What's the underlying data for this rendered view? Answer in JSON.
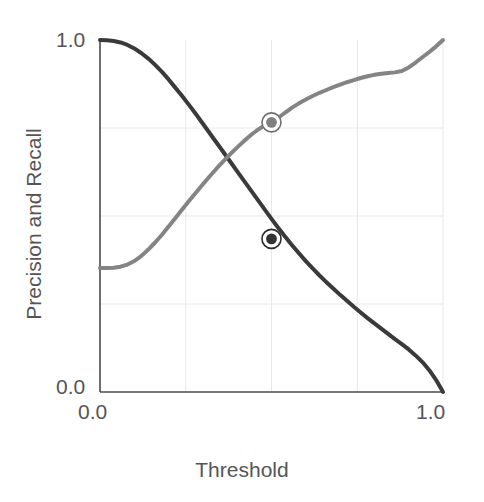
{
  "chart_data": {
    "type": "line",
    "title": "",
    "xlabel": "Threshold",
    "ylabel": "Precision and Recall",
    "xlim": [
      0.0,
      1.0
    ],
    "ylim": [
      0.0,
      1.0
    ],
    "xticks": [
      "0.0",
      "1.0"
    ],
    "xtick_values": [
      0.0,
      1.0
    ],
    "yticks": [
      "1.0",
      "0.0"
    ],
    "ytick_values": [
      1.0,
      0.0
    ],
    "grid": true,
    "grid_color": "#e8e8e8",
    "grid_x": [
      0.25,
      0.5,
      0.75,
      1.0
    ],
    "grid_y": [
      0.25,
      0.5,
      0.75
    ],
    "legend": "none",
    "axis_color": "#4a4a4a",
    "series": [
      {
        "name": "Precision",
        "color": "#3a3a3a",
        "linewidth": 4,
        "x": [
          0.0,
          0.02,
          0.04,
          0.06,
          0.08,
          0.1,
          0.12,
          0.14,
          0.16,
          0.18,
          0.2,
          0.22,
          0.24,
          0.26,
          0.28,
          0.3,
          0.32,
          0.34,
          0.36,
          0.38,
          0.4,
          0.42,
          0.44,
          0.46,
          0.48,
          0.5,
          0.52,
          0.54,
          0.56,
          0.58,
          0.6,
          0.62,
          0.64,
          0.66,
          0.68,
          0.7,
          0.72,
          0.74,
          0.76,
          0.78,
          0.8,
          0.82,
          0.84,
          0.86,
          0.88,
          0.9,
          0.92,
          0.94,
          0.96,
          0.98,
          1.0
        ],
        "values": [
          1.0,
          0.999,
          0.997,
          0.993,
          0.986,
          0.976,
          0.963,
          0.948,
          0.93,
          0.91,
          0.888,
          0.864,
          0.84,
          0.815,
          0.789,
          0.762,
          0.735,
          0.708,
          0.681,
          0.654,
          0.627,
          0.6,
          0.573,
          0.546,
          0.519,
          0.492,
          0.466,
          0.441,
          0.417,
          0.394,
          0.372,
          0.351,
          0.331,
          0.312,
          0.294,
          0.276,
          0.259,
          0.242,
          0.226,
          0.21,
          0.195,
          0.18,
          0.165,
          0.15,
          0.136,
          0.121,
          0.104,
          0.085,
          0.062,
          0.034,
          0.0
        ]
      },
      {
        "name": "Recall",
        "color": "#848484",
        "linewidth": 4,
        "x": [
          0.0,
          0.02,
          0.04,
          0.06,
          0.08,
          0.1,
          0.12,
          0.14,
          0.16,
          0.18,
          0.2,
          0.22,
          0.24,
          0.26,
          0.28,
          0.3,
          0.32,
          0.34,
          0.36,
          0.38,
          0.4,
          0.42,
          0.44,
          0.46,
          0.48,
          0.5,
          0.52,
          0.54,
          0.56,
          0.58,
          0.6,
          0.62,
          0.64,
          0.66,
          0.68,
          0.7,
          0.72,
          0.74,
          0.76,
          0.78,
          0.8,
          0.82,
          0.84,
          0.86,
          0.88,
          0.9,
          0.92,
          0.94,
          0.96,
          0.98,
          1.0
        ],
        "values": [
          0.352,
          0.352,
          0.353,
          0.356,
          0.362,
          0.372,
          0.386,
          0.404,
          0.424,
          0.446,
          0.47,
          0.494,
          0.519,
          0.543,
          0.567,
          0.59,
          0.613,
          0.635,
          0.656,
          0.676,
          0.695,
          0.713,
          0.73,
          0.745,
          0.757,
          0.766,
          0.779,
          0.794,
          0.808,
          0.82,
          0.831,
          0.841,
          0.85,
          0.858,
          0.866,
          0.873,
          0.88,
          0.886,
          0.892,
          0.897,
          0.901,
          0.904,
          0.906,
          0.908,
          0.912,
          0.922,
          0.936,
          0.951,
          0.966,
          0.982,
          1.0
        ]
      }
    ],
    "markers": [
      {
        "label": "recall-at-threshold",
        "series": "Recall",
        "x": 0.5,
        "y": 0.766,
        "fill": "#808080",
        "ring": "#ffffff",
        "edge": "#6e6e6e"
      },
      {
        "label": "precision-at-threshold",
        "series": "Precision",
        "x": 0.5,
        "y": 0.435,
        "fill": "#333333",
        "ring": "#ffffff",
        "edge": "#2b2b2b"
      }
    ]
  }
}
